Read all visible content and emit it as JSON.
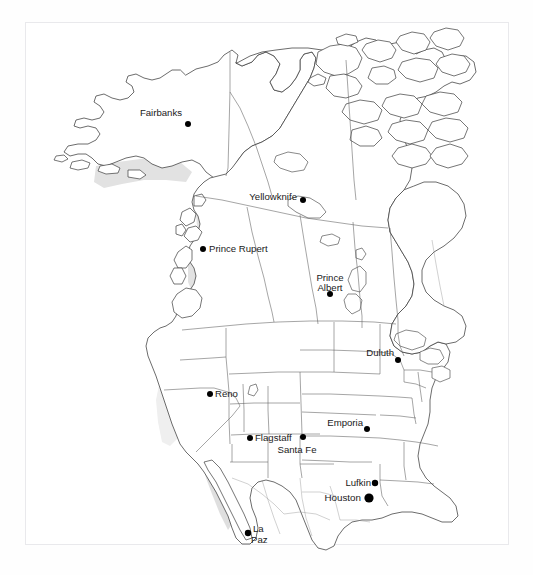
{
  "figure": {
    "frame_color": "#e9e9ec",
    "background_color": "#ffffff"
  },
  "map": {
    "region": "Western North America",
    "projection_note": "conic",
    "land_outline_color": "#3b3b3b",
    "admin_boundary_color": "#5c5c5c",
    "shade_light_color": "#e2e2e2",
    "shade_dark_color": "#b9b9b9",
    "dot_color": "#000000"
  },
  "cities": [
    {
      "name": "Fairbanks",
      "x": 181,
      "y": 121,
      "dot_x": 188,
      "dot_y": 124,
      "dot_r": 3.0,
      "anchor": "end",
      "label_x": 182,
      "label_y": 116
    },
    {
      "name": "Yellowknife",
      "x": 301,
      "y": 202,
      "dot_x": 303,
      "dot_y": 200,
      "dot_r": 3.0,
      "anchor": "end",
      "label_x": 297,
      "label_y": 200
    },
    {
      "name": "Prince Rupert",
      "x": 212,
      "y": 249,
      "dot_x": 203,
      "dot_y": 249,
      "dot_r": 3.0,
      "anchor": "start",
      "label_x": 209,
      "label_y": 252
    },
    {
      "name": "Prince",
      "x": 330,
      "y": 280,
      "dot_x": 330,
      "dot_y": 294,
      "dot_r": 3.0,
      "anchor": "middle",
      "label_x": 330,
      "label_y": 281
    },
    {
      "name": "Albert",
      "x": 330,
      "y": 291,
      "dot_x": 330,
      "dot_y": 294,
      "dot_r": 0.0,
      "anchor": "middle",
      "label_x": 330,
      "label_y": 291
    },
    {
      "name": "Duluth",
      "x": 389,
      "y": 355,
      "dot_x": 398,
      "dot_y": 360,
      "dot_r": 3.0,
      "anchor": "end",
      "label_x": 394,
      "label_y": 356
    },
    {
      "name": "Reno",
      "x": 218,
      "y": 394,
      "dot_x": 210,
      "dot_y": 394,
      "dot_r": 3.0,
      "anchor": "start",
      "label_x": 215,
      "label_y": 397
    },
    {
      "name": "Emporia",
      "x": 350,
      "y": 425,
      "dot_x": 367,
      "dot_y": 429,
      "dot_r": 3.0,
      "anchor": "end",
      "label_x": 363,
      "label_y": 426
    },
    {
      "name": "Flagstaff",
      "x": 262,
      "y": 438,
      "dot_x": 250,
      "dot_y": 438,
      "dot_r": 3.0,
      "anchor": "start",
      "label_x": 255,
      "label_y": 441
    },
    {
      "name": "Santa Fe",
      "x": 297,
      "y": 451,
      "dot_x": 303,
      "dot_y": 437,
      "dot_r": 3.0,
      "anchor": "middle",
      "label_x": 297,
      "label_y": 453
    },
    {
      "name": "Lufkin",
      "x": 364,
      "y": 483,
      "dot_x": 375,
      "dot_y": 483,
      "dot_r": 3.2,
      "anchor": "end",
      "label_x": 371,
      "label_y": 486
    },
    {
      "name": "Houston",
      "x": 352,
      "y": 498,
      "dot_x": 369,
      "dot_y": 498,
      "dot_r": 4.6,
      "anchor": "end",
      "label_x": 361,
      "label_y": 501
    },
    {
      "name": "La",
      "x": 258,
      "y": 529,
      "dot_x": 248,
      "dot_y": 533,
      "dot_r": 3.2,
      "anchor": "start",
      "label_x": 253,
      "label_y": 532
    },
    {
      "name": "Paz",
      "x": 258,
      "y": 541,
      "dot_x": 0,
      "dot_y": 0,
      "dot_r": 0.0,
      "anchor": "start",
      "label_x": 251,
      "label_y": 543
    }
  ],
  "legend": {
    "present": false
  }
}
